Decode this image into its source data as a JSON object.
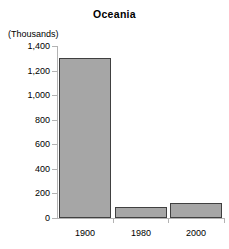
{
  "chart_data": {
    "type": "bar",
    "title": "Oceania",
    "xlabel": "",
    "ylabel": "(Thousands)",
    "categories": [
      "1900",
      "1980",
      "2000"
    ],
    "values": [
      1300,
      90,
      120
    ],
    "ylim": [
      0,
      1400
    ],
    "yticks": [
      0,
      200,
      400,
      600,
      800,
      1000,
      1200,
      1400
    ],
    "ytick_labels": [
      "0",
      "200",
      "400",
      "600",
      "800",
      "1,000",
      "1,200",
      "1,400"
    ],
    "grid": false,
    "legend": "none",
    "bar_color": "#a6a6a6",
    "bar_border_color": "#404040",
    "axis_color": "#b3b3b3",
    "text_color": "#000000"
  }
}
